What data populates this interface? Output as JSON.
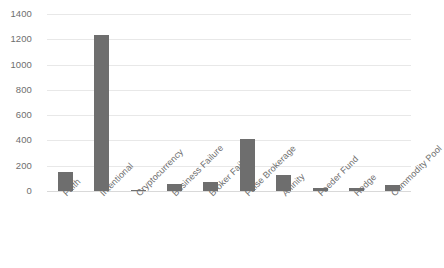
{
  "chart_data": {
    "type": "bar",
    "title": "",
    "xlabel": "",
    "ylabel": "",
    "grid": true,
    "legend": "none",
    "ylim": [
      0,
      1400
    ],
    "yticks": [
      0,
      200,
      400,
      600,
      800,
      1000,
      1200,
      1400
    ],
    "ytick_labels": [
      "0",
      "200",
      "400",
      "600",
      "800",
      "1000",
      "1200",
      "1400"
    ],
    "categories": [
      "Faith",
      "Intentional",
      "Cryptocurrency",
      "Business Failure",
      "Broker Failure",
      "False Brokerage",
      "Affinity",
      "Feeder Fund",
      "Hedge",
      "Commodity Pool"
    ],
    "values": [
      152,
      1232,
      3,
      52,
      68,
      414,
      130,
      24,
      22,
      45
    ],
    "series": [
      {
        "name": "Count",
        "values": [
          152,
          1232,
          3,
          52,
          68,
          414,
          130,
          24,
          22,
          45
        ],
        "color": "#6e6e6e"
      }
    ],
    "bar_color": "#6e6e6e",
    "gridline_color": "#e8e8e8",
    "axis_text_color": "#6e6e6e",
    "background_color": "#ffffff",
    "x_label_rotation": -45
  }
}
